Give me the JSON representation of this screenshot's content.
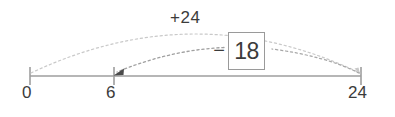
{
  "diagram": {
    "type": "number-line",
    "axis": {
      "color": "#9e9e9e",
      "ticks": [
        {
          "label": "0",
          "value": 0,
          "x": 30
        },
        {
          "label": "6",
          "value": 6,
          "x": 114
        },
        {
          "label": "24",
          "value": 24,
          "x": 361
        }
      ]
    },
    "arcs": [
      {
        "name": "add-arc",
        "label": "+24",
        "from_value": 0,
        "to_value": 24,
        "style": "dotted",
        "direction": "right",
        "color": "#b9b9b9"
      },
      {
        "name": "subtract-arc",
        "label": "18",
        "sign": "−",
        "from_value": 24,
        "to_value": 6,
        "style": "dotted",
        "direction": "left",
        "color": "#8f8f8f",
        "boxed": true
      }
    ]
  },
  "labels": {
    "tick_zero": "0",
    "tick_six": "6",
    "tick_twentyfour": "24",
    "add_label": "+24",
    "minus_sign": "−",
    "answer_value": "18"
  },
  "colors": {
    "background": "#ffffff",
    "axis": "#9e9e9e",
    "text": "#3b3b3b",
    "arc_light": "#c3c3c3",
    "arc_dark": "#8f8f8f",
    "box_border": "#9a9a9a"
  }
}
